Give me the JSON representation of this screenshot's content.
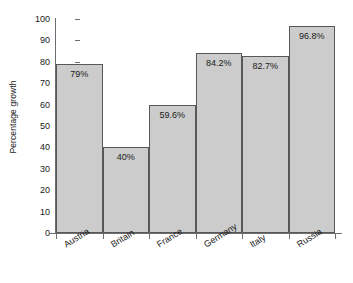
{
  "chart_data": {
    "type": "bar",
    "title": "",
    "subtitle": "",
    "xlabel": "",
    "ylabel": "Percentage growth",
    "categories": [
      "Austria",
      "Britain",
      "France",
      "Germany",
      "Italy",
      "Russia"
    ],
    "values": [
      79,
      40,
      59.6,
      84.2,
      82.7,
      96.8
    ],
    "value_labels": [
      "79%",
      "40%",
      "59.6%",
      "84.2%",
      "82.7%",
      "96.8%"
    ],
    "ylim": [
      0,
      100
    ],
    "ytick_labels": [
      "100",
      "90",
      "80",
      "70",
      "60",
      "50",
      "40",
      "30",
      "20",
      "10",
      "0"
    ],
    "ytick_values": [
      100,
      90,
      80,
      70,
      60,
      50,
      40,
      30,
      20,
      10,
      0
    ],
    "grid": false,
    "legend": null,
    "legend_position": "none",
    "annotations": [],
    "bar_label_position": "inside-top",
    "xtick_label_rotation": -32,
    "colors": {
      "bar_fill": "#cccccc",
      "bar_stroke": "#585858",
      "axis": "#6e6e6e",
      "text": "#1a1a1a",
      "background": "#ffffff"
    }
  }
}
